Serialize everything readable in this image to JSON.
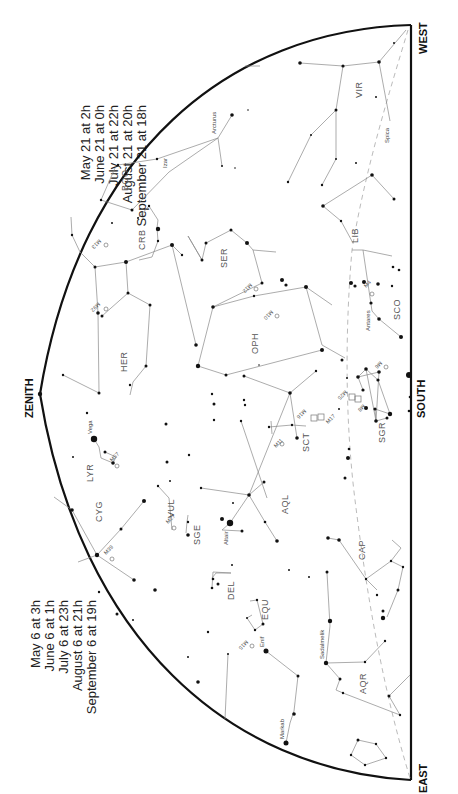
{
  "directions": {
    "west": "WEST",
    "east": "EAST",
    "south": "SOUTH",
    "zenith": "ZENITH"
  },
  "times_top": {
    "lines": [
      "May 21 at    2h",
      "June 21 at    0h",
      "July 21 at  22h",
      "August 21 at  20h",
      "September 21 at  18h"
    ]
  },
  "times_bottom": {
    "lines": [
      "May 6 at    3h",
      "June 6 at    1h",
      "July 6 at  23h",
      "August 6 at  21h",
      "September 6 at  19h"
    ]
  },
  "constellations": [
    {
      "abbr": "VIR",
      "x": 362,
      "y": 92
    },
    {
      "abbr": "BOO",
      "x": 128,
      "y": 182
    },
    {
      "abbr": "CRB",
      "x": 142,
      "y": 245
    },
    {
      "abbr": "SER",
      "x": 224,
      "y": 262
    },
    {
      "abbr": "LIB",
      "x": 356,
      "y": 236
    },
    {
      "abbr": "HER",
      "x": 126,
      "y": 348
    },
    {
      "abbr": "OPH",
      "x": 254,
      "y": 343
    },
    {
      "abbr": "SCO",
      "x": 397,
      "y": 308
    },
    {
      "abbr": "SGR",
      "x": 382,
      "y": 433
    },
    {
      "abbr": "SCT",
      "x": 306,
      "y": 443
    },
    {
      "abbr": "LYR",
      "x": 94,
      "y": 474
    },
    {
      "abbr": "CYG",
      "x": 102,
      "y": 510
    },
    {
      "abbr": "VUL",
      "x": 172,
      "y": 510
    },
    {
      "abbr": "SGE",
      "x": 200,
      "y": 537
    },
    {
      "abbr": "AQL",
      "x": 288,
      "y": 528
    },
    {
      "abbr": "CAP",
      "x": 362,
      "y": 560
    },
    {
      "abbr": "DEL",
      "x": 232,
      "y": 588
    },
    {
      "abbr": "EQU",
      "x": 268,
      "y": 610
    },
    {
      "abbr": "AQR",
      "x": 366,
      "y": 691
    }
  ],
  "named_stars": [
    {
      "name": "Arcturus",
      "x": 218,
      "y": 138,
      "r": 3.5
    },
    {
      "name": "Izar",
      "x": 169,
      "y": 172,
      "r": 1.8
    },
    {
      "name": "Spica",
      "x": 390,
      "y": 121,
      "r": 3.2
    },
    {
      "name": "Antares",
      "x": 372,
      "y": 311,
      "r": 3.2
    },
    {
      "name": "Vega",
      "x": 94,
      "y": 439,
      "r": 3.2
    },
    {
      "name": "Altair",
      "x": 230,
      "y": 523,
      "r": 3.2
    },
    {
      "name": "Enif",
      "x": 266,
      "y": 651,
      "r": 2.5
    },
    {
      "name": "Sadalmelik",
      "x": 326,
      "y": 663,
      "r": 2.2
    },
    {
      "name": "Markab",
      "x": 286,
      "y": 743,
      "r": 2.5
    }
  ],
  "deep_sky": [
    "M3",
    "M13",
    "M92",
    "M12",
    "M10",
    "M4",
    "M6",
    "M8",
    "M25",
    "M17",
    "M16",
    "M11",
    "M27",
    "M57",
    "M39",
    "M15"
  ],
  "colors": {
    "ink": "#111111",
    "lines": "#888888",
    "ecliptic": "#bbbbbb",
    "background": "#ffffff"
  }
}
